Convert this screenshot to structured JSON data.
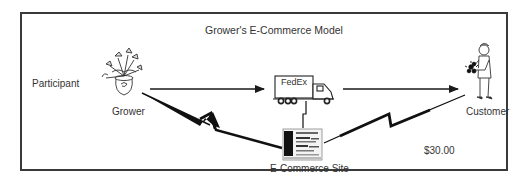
{
  "diagram": {
    "title": "Grower's E-Commerce Model",
    "row_label": "Participant",
    "nodes": {
      "grower": {
        "label": "Grower",
        "icon": "potted-plant-icon"
      },
      "shipper": {
        "label": "FedEx",
        "icon": "delivery-truck-icon"
      },
      "customer": {
        "label": "Customer",
        "icon": "person-holding-flowers-icon"
      },
      "site": {
        "label": "E-Commerce Site",
        "icon": "web-page-screen-icon"
      }
    },
    "price": "$30.00",
    "edges": [
      {
        "from": "Grower",
        "to": "FedEx",
        "type": "arrow"
      },
      {
        "from": "FedEx",
        "to": "Customer",
        "type": "arrow"
      },
      {
        "from": "Grower",
        "to": "E-Commerce Site",
        "type": "lightning-link"
      },
      {
        "from": "FedEx",
        "to": "E-Commerce Site",
        "type": "lightning-link"
      },
      {
        "from": "Customer",
        "to": "E-Commerce Site",
        "type": "lightning-link"
      }
    ],
    "colors": {
      "line": "#1a1a1a",
      "border": "#3a3a3a",
      "text": "#333333"
    }
  }
}
